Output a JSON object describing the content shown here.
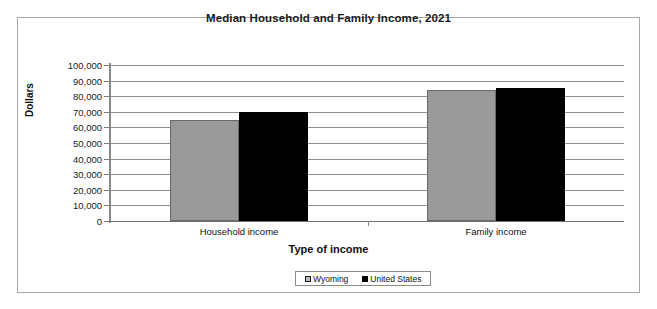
{
  "chart_data": {
    "type": "bar",
    "title": "Median Household and Family Income, 2021",
    "xlabel": "Type of income",
    "ylabel": "Dollars",
    "categories": [
      "Household income",
      "Family income"
    ],
    "series": [
      {
        "name": "Wyoming",
        "color": "#9a9a9a",
        "values": [
          65000,
          84000
        ]
      },
      {
        "name": "United States",
        "color": "#000000",
        "values": [
          70000,
          85000
        ]
      }
    ],
    "ylim": [
      0,
      100000
    ],
    "ytick_step": 10000,
    "ytick_labels": [
      "100,000",
      "90,000",
      "80,000",
      "70,000",
      "60,000",
      "50,000",
      "40,000",
      "30,000",
      "20,000",
      "10,000",
      "0"
    ],
    "grid": true,
    "legend_position": "bottom"
  }
}
